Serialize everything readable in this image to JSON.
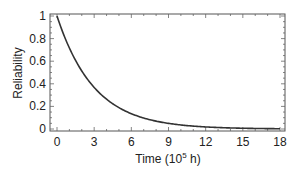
{
  "chart_data": {
    "type": "line",
    "title": "",
    "xlabel": "Time (10^5 h)",
    "xlabel_parts": {
      "main": "Time (10",
      "sup": "5",
      "tail": " h)"
    },
    "ylabel": "Reliability",
    "xlim": [
      0,
      18
    ],
    "ylim": [
      0,
      1
    ],
    "xticks": [
      0,
      3,
      6,
      9,
      12,
      15,
      18
    ],
    "yticks": [
      0,
      0.2,
      0.4,
      0.6,
      0.8,
      1
    ],
    "ytick_labels": [
      "0",
      "0.2",
      "0.4",
      "0.6",
      "0.8",
      "1"
    ],
    "grid": false,
    "legend": null,
    "series": [
      {
        "name": "Reliability",
        "color": "#333333",
        "x": [
          0,
          1,
          2,
          3,
          4,
          5,
          6,
          7,
          8,
          9,
          10,
          11,
          12,
          13,
          14,
          15,
          16,
          17,
          18
        ],
        "y": [
          1.0,
          0.72,
          0.51,
          0.37,
          0.26,
          0.19,
          0.14,
          0.1,
          0.07,
          0.05,
          0.04,
          0.03,
          0.02,
          0.01,
          0.01,
          0.01,
          0.0,
          0.0,
          0.0
        ]
      }
    ]
  }
}
